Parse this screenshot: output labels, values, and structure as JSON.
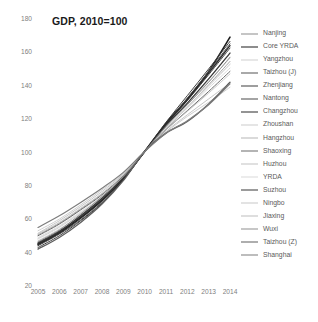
{
  "chart_data": {
    "type": "line",
    "title": "GDP, 2010=100",
    "xlabel": "",
    "ylabel": "",
    "x": [
      2005,
      2006,
      2007,
      2008,
      2009,
      2010,
      2011,
      2012,
      2013,
      2014
    ],
    "xlim": [
      2005,
      2014
    ],
    "ylim": [
      20,
      180
    ],
    "yticks": [
      20,
      40,
      60,
      80,
      100,
      120,
      140,
      160,
      180
    ],
    "xticks": [
      "2005",
      "2006",
      "2007",
      "2008",
      "2009",
      "2010",
      "2011",
      "2012",
      "2013",
      "2014"
    ],
    "grid": false,
    "legend_position": "right",
    "series": [
      {
        "name": "Nanjing",
        "color": "#8c8c8c",
        "width": 0.8,
        "values": [
          50.0,
          57.0,
          65.5,
          74.5,
          85.5,
          100.0,
          113.5,
          126.5,
          140.0,
          154.0
        ]
      },
      {
        "name": "Core YRDA",
        "color": "#1c1c1c",
        "width": 1.6,
        "values": [
          44.5,
          51.5,
          60.5,
          71.0,
          84.0,
          100.0,
          117.0,
          131.5,
          148.0,
          168.5
        ]
      },
      {
        "name": "Yangzhou",
        "color": "#d0d0d0",
        "width": 0.8,
        "values": [
          48.0,
          55.0,
          63.5,
          73.0,
          85.0,
          100.0,
          114.0,
          126.0,
          138.0,
          150.0
        ]
      },
      {
        "name": "Taizhou (J)",
        "color": "#555555",
        "width": 1.0,
        "values": [
          43.5,
          50.5,
          59.0,
          69.5,
          83.0,
          100.0,
          116.5,
          132.0,
          148.0,
          164.5
        ]
      },
      {
        "name": "Zhenjiang",
        "color": "#3f3f3f",
        "width": 1.0,
        "values": [
          42.5,
          49.5,
          58.5,
          69.0,
          83.0,
          100.0,
          117.5,
          133.5,
          149.5,
          166.0
        ]
      },
      {
        "name": "Nantong",
        "color": "#4a4a4a",
        "width": 1.0,
        "values": [
          45.5,
          52.5,
          61.0,
          71.5,
          84.0,
          100.0,
          116.0,
          130.5,
          146.0,
          162.0
        ]
      },
      {
        "name": "Changzhou",
        "color": "#2a2a2a",
        "width": 1.3,
        "values": [
          44.0,
          51.0,
          60.0,
          70.5,
          83.5,
          100.0,
          116.5,
          131.0,
          147.0,
          163.5
        ]
      },
      {
        "name": "Zhoushan",
        "color": "#cccccc",
        "width": 0.8,
        "values": [
          47.5,
          54.5,
          63.0,
          72.5,
          84.5,
          100.0,
          114.5,
          127.0,
          139.5,
          152.5
        ]
      },
      {
        "name": "Hangzhou",
        "color": "#b5b5b5",
        "width": 0.8,
        "values": [
          51.0,
          58.5,
          67.0,
          76.0,
          86.5,
          100.0,
          112.0,
          122.0,
          131.5,
          141.0
        ]
      },
      {
        "name": "Shaoxing",
        "color": "#6b6b6b",
        "width": 1.0,
        "values": [
          49.5,
          56.5,
          65.0,
          74.0,
          85.5,
          100.0,
          113.0,
          124.5,
          136.0,
          148.0
        ]
      },
      {
        "name": "Huzhou",
        "color": "#c2c2c2",
        "width": 0.8,
        "values": [
          46.5,
          53.5,
          62.0,
          72.0,
          84.5,
          100.0,
          115.0,
          128.5,
          142.0,
          156.0
        ]
      },
      {
        "name": "YRDA",
        "color": "#dadada",
        "width": 0.8,
        "values": [
          48.5,
          55.5,
          64.0,
          73.5,
          85.0,
          100.0,
          114.0,
          126.5,
          139.0,
          152.0
        ]
      },
      {
        "name": "Suzhou",
        "color": "#383838",
        "width": 1.3,
        "values": [
          45.0,
          52.0,
          61.5,
          72.0,
          84.5,
          100.0,
          115.5,
          129.0,
          143.5,
          159.0
        ]
      },
      {
        "name": "Ningbo",
        "color": "#c8c8c8",
        "width": 0.9,
        "values": [
          52.5,
          59.5,
          68.0,
          77.0,
          87.0,
          100.0,
          111.5,
          121.0,
          129.5,
          138.5
        ]
      },
      {
        "name": "Jiaxing",
        "color": "#bdbdbd",
        "width": 0.8,
        "values": [
          50.5,
          57.5,
          66.0,
          75.0,
          86.0,
          100.0,
          113.0,
          124.0,
          135.0,
          146.5
        ]
      },
      {
        "name": "Wuxi",
        "color": "#8f8f8f",
        "width": 1.0,
        "values": [
          46.0,
          53.0,
          62.5,
          73.0,
          85.0,
          100.0,
          115.0,
          128.0,
          141.5,
          156.5
        ]
      },
      {
        "name": "Taizhou (Z)",
        "color": "#5e5e5e",
        "width": 1.3,
        "values": [
          41.5,
          48.5,
          57.5,
          68.5,
          82.5,
          100.0,
          111.0,
          118.0,
          128.5,
          141.5
        ]
      },
      {
        "name": "Shanghai",
        "color": "#7d7d7d",
        "width": 1.2,
        "values": [
          54.5,
          61.5,
          69.5,
          78.0,
          87.5,
          100.0,
          111.0,
          118.5,
          128.0,
          140.5
        ]
      }
    ]
  }
}
